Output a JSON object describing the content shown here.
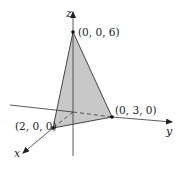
{
  "diagram": {
    "type": "3d-coordinate-plot",
    "axes": {
      "x": {
        "label": "x"
      },
      "y": {
        "label": "y"
      },
      "z": {
        "label": "z"
      }
    },
    "points": [
      {
        "id": "pz",
        "label": "(0, 0, 6)"
      },
      {
        "id": "py",
        "label": "(0, 3, 0)"
      },
      {
        "id": "px",
        "label": "(2, 0, 0)"
      }
    ],
    "colors": {
      "face": "#c8c8c8",
      "line": "#333333",
      "background": "#ffffff"
    }
  }
}
